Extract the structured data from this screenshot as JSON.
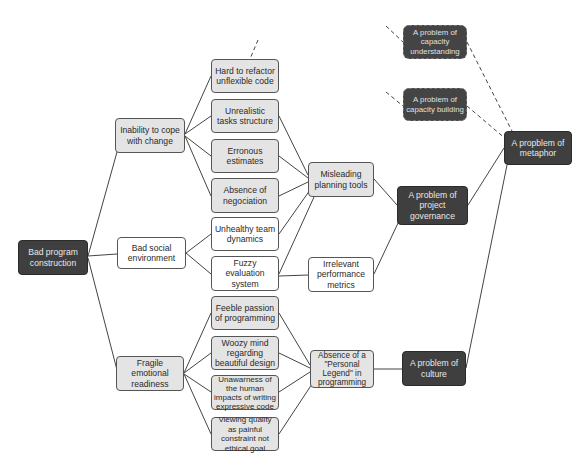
{
  "diagram": {
    "colors": {
      "dark_node": "#3f3f3f",
      "light_node": "#e4e4e4",
      "white_node": "#ffffff",
      "line": "#444444"
    },
    "root": {
      "label": "Bad program construction"
    },
    "level1": [
      {
        "id": "inability",
        "label": "Inability to cope with change"
      },
      {
        "id": "social",
        "label": "Bad social environment"
      },
      {
        "id": "fragile",
        "label": "Fragile emotional readiness"
      }
    ],
    "level2": [
      {
        "id": "refactor",
        "label": "Hard to refactor unflexible code"
      },
      {
        "id": "unrealistic",
        "label": "Unrealistic tasks structure"
      },
      {
        "id": "erroneous",
        "label": "Erronous estimates"
      },
      {
        "id": "negociation",
        "label": "Absence of negociation"
      },
      {
        "id": "unhealthy",
        "label": "Unhealthy team dynamics"
      },
      {
        "id": "fuzzy",
        "label": "Fuzzy evaluation system"
      },
      {
        "id": "feeble",
        "label": "Feeble passion of programming"
      },
      {
        "id": "woozy",
        "label": "Woozy mind regarding beautiful design"
      },
      {
        "id": "unawarness",
        "label": "Unawarness of the human impacts of writing expressive code"
      },
      {
        "id": "viewing",
        "label": "Viewing quality as painful constraint not ethical goal"
      }
    ],
    "level3": [
      {
        "id": "misleading",
        "label": "Misleading planning tools"
      },
      {
        "id": "irrelevant",
        "label": "Irrelevant performance metrics"
      },
      {
        "id": "legend",
        "label": "Absence of a \"Personal Legend\" in programming"
      }
    ],
    "level4": [
      {
        "id": "cap_understanding",
        "label": "A problem of capacity understanding",
        "style": "dashed"
      },
      {
        "id": "cap_building",
        "label": "A problem of capacity building",
        "style": "dashed"
      },
      {
        "id": "governance",
        "label": "A problem of project governance",
        "style": "solid"
      },
      {
        "id": "culture",
        "label": "A problem of culture",
        "style": "solid"
      }
    ],
    "level5": [
      {
        "id": "metaphor",
        "label": "A propblem of metaphor"
      }
    ]
  }
}
